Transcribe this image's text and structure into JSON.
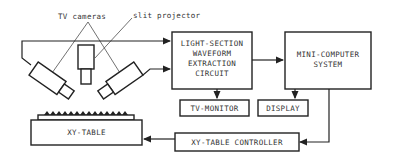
{
  "diagram": {
    "labels": {
      "tv_cameras": "TV cameras",
      "slit_projector": "slit projector"
    },
    "blocks": {
      "light_section": [
        "LIGHT-SECTION",
        "WAVEFORM",
        "EXTRACTION",
        "CIRCUIT"
      ],
      "mini_computer": [
        "MINI-COMPUTER",
        "SYSTEM"
      ],
      "tv_monitor": "TV-MONITOR",
      "display": "DISPLAY",
      "xy_table_controller": "XY-TABLE CONTROLLER",
      "xy_table": "XY-TABLE"
    },
    "colors": {
      "line": "#222222",
      "text": "#333333",
      "background": "#ffffff"
    }
  }
}
